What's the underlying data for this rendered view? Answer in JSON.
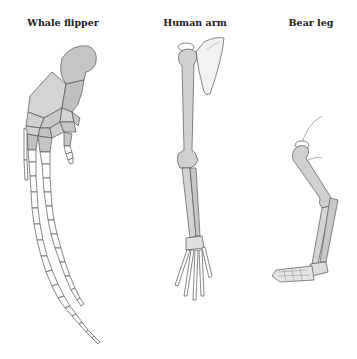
{
  "diagram": {
    "type": "homologous-structures",
    "panels": [
      {
        "id": "whale",
        "label": "Whale flipper"
      },
      {
        "id": "human",
        "label": "Human arm"
      },
      {
        "id": "bear",
        "label": "Bear leg"
      }
    ]
  },
  "colors": {
    "background": "#ffffff",
    "bone_fill_dark": "#c4c4c4",
    "bone_fill_light": "#d9d9d9",
    "bone_fill_white": "#ffffff",
    "outline": "#555555",
    "label": "#1a1a1a"
  }
}
